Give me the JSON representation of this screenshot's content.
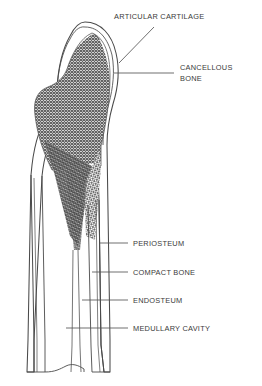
{
  "figure": {
    "background_color": "#ffffff",
    "line_color": "#4a4a4a",
    "text_color": "#3a3a3a",
    "cancellous_fill": "#6e6e6e",
    "trabecular_fill": "#555555"
  },
  "labels": [
    {
      "id": "articular-cartilage",
      "text": "ARTICULAR CARTILAGE",
      "x": 114,
      "y": 12,
      "leader": "diagonal"
    },
    {
      "id": "cancellous-bone",
      "text": "CANCELLOUS BONE",
      "line1": "CANCELLOUS",
      "line2": "BONE",
      "x": 180,
      "y": 68,
      "leader": "horizontal"
    },
    {
      "id": "periosteum",
      "text": "PERIOSTEUM",
      "x": 133,
      "y": 239,
      "leader": "horizontal"
    },
    {
      "id": "compact-bone",
      "text": "COMPACT BONE",
      "x": 133,
      "y": 268,
      "leader": "horizontal"
    },
    {
      "id": "endosteum",
      "text": "ENDOSTEUM",
      "x": 133,
      "y": 296,
      "leader": "horizontal"
    },
    {
      "id": "medullary-cavity",
      "text": "MEDULLARY CAVITY",
      "x": 133,
      "y": 324,
      "leader": "horizontal"
    }
  ]
}
